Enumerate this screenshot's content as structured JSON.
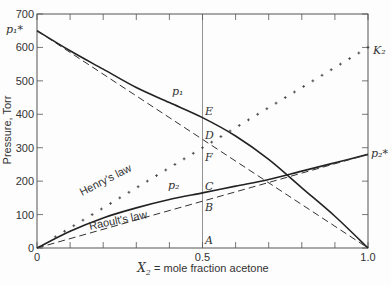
{
  "chart_data": {
    "type": "line",
    "title": "",
    "xlabel": "X₂ = mole fraction acetone",
    "ylabel": "Pressure, Torr",
    "xlim": [
      0,
      1.0
    ],
    "ylim": [
      0,
      700
    ],
    "x_ticks": [
      0,
      0.1,
      0.2,
      0.3,
      0.4,
      0.5,
      0.6,
      0.7,
      0.8,
      0.9,
      1.0
    ],
    "x_tick_labels": [
      "0",
      "0.5",
      "1.0"
    ],
    "y_ticks": [
      0,
      100,
      200,
      300,
      400,
      500,
      600,
      700
    ],
    "y_tick_labels": [
      "0",
      "100",
      "200",
      "300",
      "400",
      "500",
      "600",
      "700"
    ],
    "grid": false,
    "x": [
      0,
      0.1,
      0.2,
      0.3,
      0.4,
      0.5,
      0.6,
      0.7,
      0.8,
      0.9,
      1.0
    ],
    "series": [
      {
        "name": "p1",
        "style": "solid",
        "values": [
          650,
          590,
          535,
          480,
          435,
          390,
          335,
          265,
          180,
          95,
          0
        ]
      },
      {
        "name": "p2",
        "style": "solid",
        "values": [
          0,
          50,
          90,
          120,
          145,
          165,
          185,
          205,
          230,
          255,
          280
        ]
      },
      {
        "name": "Raoult's law (p1 ideal)",
        "style": "dashed",
        "values": [
          650,
          585,
          520,
          455,
          390,
          325,
          260,
          195,
          130,
          65,
          0
        ]
      },
      {
        "name": "Raoult's law",
        "style": "dashed",
        "values": [
          0,
          28,
          56,
          84,
          112,
          140,
          168,
          196,
          224,
          252,
          280
        ]
      },
      {
        "name": "Henry's law",
        "style": "crosses",
        "values": [
          0,
          60,
          120,
          180,
          240,
          300,
          360,
          420,
          480,
          540,
          600
        ]
      }
    ],
    "annotations": [
      {
        "text": "p1*",
        "x": 0,
        "y": 650
      },
      {
        "text": "p2*",
        "x": 1.0,
        "y": 280
      },
      {
        "text": "K2",
        "x": 1.0,
        "y": 600
      },
      {
        "text": "p1",
        "x": 0.3,
        "y": 500
      },
      {
        "text": "p2",
        "x": 0.35,
        "y": 175
      },
      {
        "text": "E",
        "x": 0.5,
        "y": 390
      },
      {
        "text": "D",
        "x": 0.5,
        "y": 325
      },
      {
        "text": "F",
        "x": 0.5,
        "y": 300
      },
      {
        "text": "C",
        "x": 0.5,
        "y": 165
      },
      {
        "text": "B",
        "x": 0.5,
        "y": 140
      },
      {
        "text": "A",
        "x": 0.5,
        "y": 0
      },
      {
        "text": "Henry's law",
        "x": 0.22,
        "y": 215
      },
      {
        "text": "Raoult's law",
        "x": 0.32,
        "y": 100
      }
    ],
    "vertical_line_at_x": 0.5
  },
  "labels": {
    "xlabel_var": "X",
    "xlabel_sub": "2",
    "xlabel_rest": " = mole fraction acetone",
    "ylabel": "Pressure, Torr",
    "p1star": "p₁*",
    "p2star": "p₂*",
    "K2": "K₂",
    "p1": "p₁",
    "p2": "p₂",
    "E": "E",
    "D": "D",
    "F": "F",
    "C": "C",
    "B": "B",
    "A": "A",
    "henry": "Henry's law",
    "raoult": "Raoult's law"
  }
}
